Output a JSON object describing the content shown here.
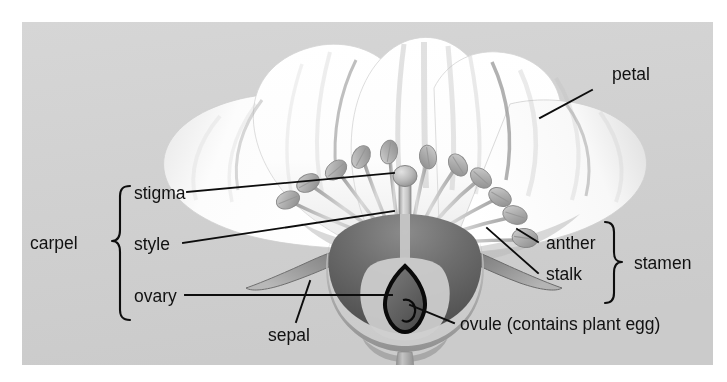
{
  "figure": {
    "panel": {
      "background_color": "#d2d2d2",
      "x": 22,
      "y": 22,
      "width": 691,
      "height": 343
    },
    "page_background_color": "#ffffff",
    "ink_color": "#0d0d0d"
  },
  "labels": {
    "petal": "petal",
    "stigma": "stigma",
    "style": "style",
    "ovary": "ovary",
    "carpel": "carpel",
    "sepal": "sepal",
    "anther": "anther",
    "stalk": "stalk",
    "stamen": "stamen",
    "ovule": "ovule (contains plant egg)"
  },
  "groups": {
    "carpel": {
      "name": "carpel",
      "members": [
        "stigma",
        "style",
        "ovary"
      ],
      "brace_side": "left"
    },
    "stamen": {
      "name": "stamen",
      "members": [
        "anther",
        "stalk"
      ],
      "brace_side": "right"
    }
  },
  "parts": {
    "petal": {
      "label": "petal",
      "color": "#fbfbfb",
      "count": 5
    },
    "sepal": {
      "label": "sepal",
      "color": "#8e8e8e",
      "count": 2
    },
    "anther": {
      "label": "anther",
      "color": "#b4b4b4",
      "count": 11
    },
    "stalk": {
      "label": "stalk",
      "color": "#c6c6c6"
    },
    "stigma": {
      "label": "stigma",
      "color": "#c2c2c2"
    },
    "style": {
      "label": "style",
      "color": "#cfcfcf"
    },
    "ovary": {
      "label": "ovary",
      "color": "#6b6b6b"
    },
    "ovule": {
      "label": "ovule (contains plant egg)",
      "color": "#5a5a5a",
      "outline_color": "#0a0a0a"
    }
  }
}
